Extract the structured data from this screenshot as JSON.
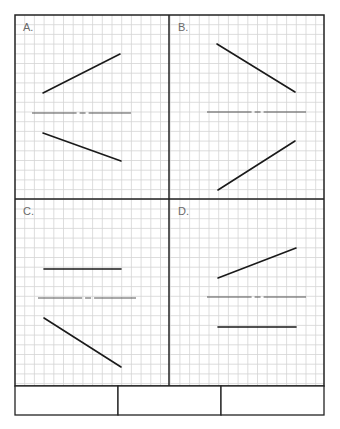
{
  "worksheet": {
    "grid": {
      "spacing": 9.7,
      "color": "#d4d4d4"
    },
    "border_color": "#222222",
    "line_color": "#1a1a1a",
    "axis_color": "#555555",
    "panels": [
      {
        "id": "A",
        "label": "A.",
        "segments": [
          {
            "x1": 43,
            "y1": 93,
            "x2": 120,
            "y2": 54
          },
          {
            "x1": 43,
            "y1": 133,
            "x2": 121,
            "y2": 161
          }
        ],
        "axis": {
          "x1": 32,
          "x2": 131,
          "y": 113
        }
      },
      {
        "id": "B",
        "label": "B.",
        "segments": [
          {
            "x1": 217,
            "y1": 44,
            "x2": 295,
            "y2": 92
          },
          {
            "x1": 295,
            "y1": 141,
            "x2": 218,
            "y2": 190
          }
        ],
        "axis": {
          "x1": 207,
          "x2": 306,
          "y": 112
        }
      },
      {
        "id": "C",
        "label": "C.",
        "segments": [
          {
            "x1": 44,
            "y1": 269,
            "x2": 121,
            "y2": 269
          },
          {
            "x1": 44,
            "y1": 318,
            "x2": 121,
            "y2": 367
          }
        ],
        "axis": {
          "x1": 38,
          "x2": 136,
          "y": 298
        }
      },
      {
        "id": "D",
        "label": "D.",
        "segments": [
          {
            "x1": 218,
            "y1": 278,
            "x2": 296,
            "y2": 248
          },
          {
            "x1": 218,
            "y1": 327,
            "x2": 296,
            "y2": 327
          }
        ],
        "axis": {
          "x1": 207,
          "x2": 306,
          "y": 297
        }
      }
    ],
    "answer_boxes": [
      "",
      "",
      ""
    ]
  }
}
